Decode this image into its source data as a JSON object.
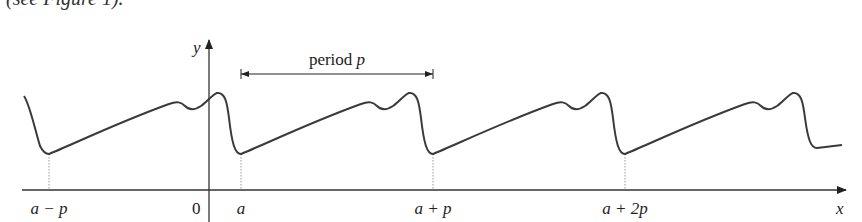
{
  "caption_fragment": "(see Figure 1).",
  "axes": {
    "x_label": "x",
    "y_label": "y",
    "origin_label": "0"
  },
  "period_annotation": {
    "label_text": "period ",
    "label_var": "p"
  },
  "tick_labels": [
    {
      "text": "a − p",
      "position": -1
    },
    {
      "text": "a",
      "position": 0
    },
    {
      "text": "a + p",
      "position": 1
    },
    {
      "text": "a + 2p",
      "position": 2
    }
  ],
  "colors": {
    "curve": "#3a3a3a",
    "axis": "#333333",
    "guide": "#9a9a9a"
  },
  "chart_data": {
    "type": "line",
    "xlabel": "x",
    "ylabel": "y",
    "minima_at": [
      "a − p",
      "a",
      "a + p",
      "a + 2p"
    ],
    "period": "p",
    "grid": false
  }
}
